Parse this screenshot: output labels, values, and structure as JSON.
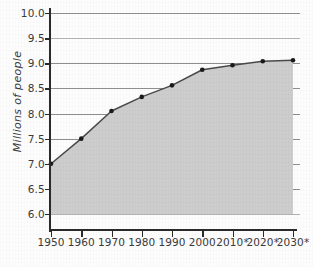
{
  "chart_data": {
    "type": "area",
    "title": "",
    "xlabel": "",
    "ylabel": "Millions of people",
    "categories": [
      "1950",
      "1960",
      "1970",
      "1980",
      "1990",
      "2000",
      "2010*",
      "2020*",
      "2030*"
    ],
    "x": [
      1950,
      1960,
      1970,
      1980,
      1990,
      2000,
      2010,
      2020,
      2030
    ],
    "values": [
      7.0,
      7.5,
      8.05,
      8.33,
      8.56,
      8.87,
      8.96,
      9.04,
      9.06
    ],
    "series": [
      {
        "name": "Population",
        "values": [
          7.0,
          7.5,
          8.05,
          8.33,
          8.56,
          8.87,
          8.96,
          9.04,
          9.06
        ]
      }
    ],
    "ylim": [
      6.0,
      10.0
    ],
    "ytick_labels": [
      "10.0",
      "9.5",
      "9.0",
      "8.5",
      "8.0",
      "7.5",
      "7.0",
      "6.5",
      "6.0"
    ],
    "yticks": [
      10.0,
      9.5,
      9.0,
      8.5,
      8.0,
      7.5,
      7.0,
      6.5,
      6.0
    ],
    "grid": true,
    "legend": "none",
    "annotations": [],
    "colors": {
      "area_fill": "#cdcdcd",
      "line": "#4a4a4a",
      "marker": "#1a1a1a",
      "gridline": "#8f8f8f",
      "axis": "#2b2b2b",
      "text": "#3a3a3a",
      "background": "#fdfdfd"
    }
  }
}
